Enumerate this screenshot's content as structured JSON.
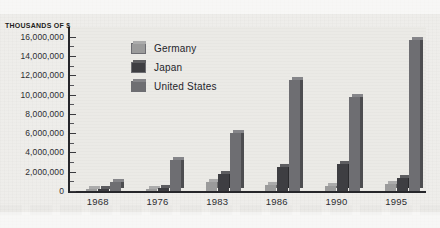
{
  "chart_data": {
    "type": "bar",
    "title": "",
    "subtitle": "",
    "xlabel": "",
    "ylabel": "THOUSANDS OF $",
    "categories": [
      "1968",
      "1976",
      "1983",
      "1986",
      "1990",
      "1995"
    ],
    "series": [
      {
        "name": "Germany",
        "color": "#9b9b9b",
        "values": [
          120000,
          250000,
          900000,
          650000,
          550000,
          700000
        ]
      },
      {
        "name": "Japan",
        "color": "#3e3e42",
        "values": [
          130000,
          300000,
          1800000,
          2500000,
          2800000,
          1400000
        ]
      },
      {
        "name": "United States",
        "color": "#6e6e72",
        "values": [
          900000,
          3200000,
          6000000,
          11500000,
          9700000,
          15700000
        ]
      }
    ],
    "ylim": [
      0,
      17000000
    ],
    "ytick_values": [
      0,
      2000000,
      4000000,
      6000000,
      8000000,
      10000000,
      12000000,
      14000000,
      16000000
    ],
    "ytick_labels": [
      "0",
      "2,000,000",
      "4,000,000",
      "6,000,000",
      "8,000,000",
      "10,000,000",
      "12,000,000",
      "14,000,000",
      "16,000,000"
    ],
    "minor_ticks": true,
    "grid": false,
    "legend_position": "inside-top-left",
    "legend_entries": [
      "Germany",
      "Japan",
      "United States"
    ],
    "background_color": "#ebeae6",
    "axis_color": "#26262a",
    "text_color": "#2c2c30"
  }
}
